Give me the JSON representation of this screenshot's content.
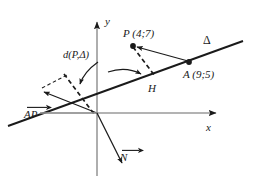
{
  "figure": {
    "background": "#ffffff",
    "axis_color": "#9a9a9a",
    "line_color": "#1a1a1a",
    "dash_color": "#1a1a1a",
    "width": 258,
    "height": 187
  },
  "axes": {
    "x_label": "x",
    "y_label": "y",
    "origin": {
      "x": 97,
      "y": 113
    }
  },
  "labels": {
    "point_p": "P (4;7)",
    "point_a": "A (9;5)",
    "point_h": "H",
    "line_delta": "Δ",
    "distance": "d(P,Δ)",
    "vector_ap": "AP",
    "vector_n": "N"
  },
  "points": [
    {
      "name": "P",
      "label": "P (4;7)",
      "x": 133,
      "y": 45,
      "coords": [
        4,
        7
      ]
    },
    {
      "name": "A",
      "label": "A (9;5)",
      "x": 189,
      "y": 62,
      "coords": [
        9,
        5
      ]
    },
    {
      "name": "H",
      "label": "H",
      "x": 152,
      "y": 80
    }
  ],
  "vectors": [
    {
      "name": "AP",
      "label": "AP",
      "from": [
        97,
        113
      ],
      "to": [
        45,
        92
      ]
    },
    {
      "name": "N",
      "label": "N",
      "from": [
        97,
        113
      ],
      "to": [
        123,
        165
      ]
    },
    {
      "name": "AP-translated",
      "label": "AP",
      "from": [
        189,
        62
      ],
      "to": [
        133,
        45
      ]
    }
  ],
  "segments": [
    {
      "name": "line-delta",
      "style": "solid",
      "from": [
        10,
        125
      ],
      "to": [
        240,
        42
      ]
    },
    {
      "name": "PH-dashed",
      "style": "dashed",
      "from": [
        133,
        47
      ],
      "to": [
        155,
        75
      ]
    },
    {
      "name": "projection-dashed",
      "style": "dashed",
      "from": [
        62,
        78
      ],
      "to": [
        92,
        113
      ]
    },
    {
      "name": "construction-dashed",
      "style": "dashed",
      "from": [
        42,
        88
      ],
      "to": [
        64,
        76
      ]
    }
  ]
}
